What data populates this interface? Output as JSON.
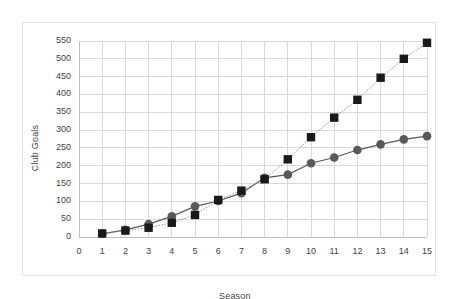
{
  "chart_data": {
    "type": "line",
    "title": "",
    "subtitle": "",
    "xlabel": "Season",
    "ylabel": "Club Goals",
    "xlim": [
      0,
      15
    ],
    "ylim": [
      0,
      550
    ],
    "x_ticks": [
      "0",
      "1",
      "2",
      "3",
      "4",
      "5",
      "6",
      "7",
      "8",
      "9",
      "10",
      "11",
      "12",
      "13",
      "14",
      "15"
    ],
    "y_ticks": [
      "0",
      "50",
      "100",
      "150",
      "200",
      "250",
      "300",
      "350",
      "400",
      "450",
      "500",
      "550"
    ],
    "grid": true,
    "legend": "none",
    "x": [
      1,
      2,
      3,
      4,
      5,
      6,
      7,
      8,
      9,
      10,
      11,
      12,
      13,
      14,
      15
    ],
    "series": [
      {
        "name": "squares-dotted",
        "marker": "square",
        "color": "#1a1a1a",
        "line_style": "dotted",
        "values": [
          10,
          18,
          26,
          40,
          62,
          104,
          130,
          162,
          218,
          280,
          335,
          385,
          447,
          500,
          545
        ]
      },
      {
        "name": "circles-solid",
        "marker": "circle",
        "color": "#595959",
        "line_style": "solid",
        "values": [
          9,
          20,
          36,
          58,
          86,
          101,
          123,
          166,
          175,
          207,
          223,
          244,
          260,
          274,
          283
        ]
      }
    ]
  },
  "colors": {
    "frame_border": "#e2e2e2",
    "gridline": "#d9d9d9",
    "axis_line": "#bfbfbf",
    "tick_text": "#3f3f3f",
    "series_dark": "#1a1a1a",
    "series_gray": "#595959"
  }
}
